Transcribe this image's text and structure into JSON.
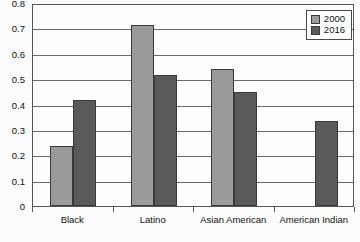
{
  "chart_data": {
    "type": "bar",
    "title": "",
    "xlabel": "",
    "ylabel": "",
    "ylim": [
      0,
      0.8
    ],
    "yticks": [
      "0",
      "0.1",
      "0.2",
      "0.3",
      "0.4",
      "0.5",
      "0.6",
      "0.7",
      "0.8"
    ],
    "ytick_values": [
      0,
      0.1,
      0.2,
      0.3,
      0.4,
      0.5,
      0.6,
      0.7,
      0.8
    ],
    "grid": true,
    "legend_position": "top-right",
    "categories": [
      "Black",
      "Latino",
      "Asian American",
      "American Indian"
    ],
    "series": [
      {
        "name": "2000",
        "color": "#9a9a9a",
        "values": [
          0.24,
          0.72,
          0.545,
          null
        ]
      },
      {
        "name": "2016",
        "color": "#5a5a5a",
        "values": [
          0.42,
          0.52,
          0.455,
          0.34
        ]
      }
    ]
  },
  "legend": {
    "items": [
      {
        "label": "2000",
        "color": "#9a9a9a"
      },
      {
        "label": "2016",
        "color": "#5a5a5a"
      }
    ]
  },
  "colors": {
    "series_2000": "#9a9a9a",
    "series_2016": "#5a5a5a",
    "axis": "#555555",
    "grid": "#6a6a6a",
    "background": "#fbfbfb"
  }
}
